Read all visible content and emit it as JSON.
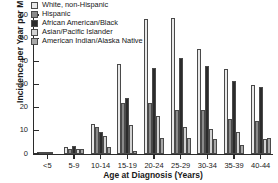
{
  "chart_data": {
    "type": "bar",
    "title": "",
    "xlabel": "Age at Diagnosis (Years)",
    "ylabel": "Incidence per Year per Million",
    "categories": [
      "<5",
      "5-9",
      "10-14",
      "15-19",
      "20-24",
      "25-29",
      "30-34",
      "35-39",
      "40-44"
    ],
    "ylim": [
      0,
      60
    ],
    "yticks": [
      0,
      10,
      20,
      30,
      40,
      50,
      60
    ],
    "grid": false,
    "legend_position": "top-left",
    "series": [
      {
        "name": "White, non-Hispanic",
        "color": "#e8e8e8",
        "values": [
          0.8,
          3.0,
          13.0,
          38.7,
          58.2,
          58.7,
          45.4,
          36.6,
          29.6
        ]
      },
      {
        "name": "Hispanic",
        "color": "#8a8a8a",
        "values": [
          0.6,
          2.0,
          11.6,
          22.2,
          21.9,
          19.1,
          19.0,
          15.1,
          14.4
        ]
      },
      {
        "name": "African American/Black",
        "color": "#2b2b2b",
        "values": [
          0.5,
          3.6,
          9.5,
          24.0,
          37.3,
          41.3,
          38.2,
          31.5,
          28.9
        ]
      },
      {
        "name": "Asian/Pacific Islander",
        "color": "#d2d2d2",
        "values": [
          0.4,
          2.2,
          7.6,
          12.4,
          16.5,
          11.6,
          11.0,
          9.7,
          6.5
        ]
      },
      {
        "name": "American Indian/Alaska Native",
        "color": "#a8a8a8",
        "values": [
          0.0,
          2.1,
          3.1,
          1.1,
          6.7,
          6.8,
          6.4,
          3.9,
          7.1
        ]
      }
    ]
  }
}
